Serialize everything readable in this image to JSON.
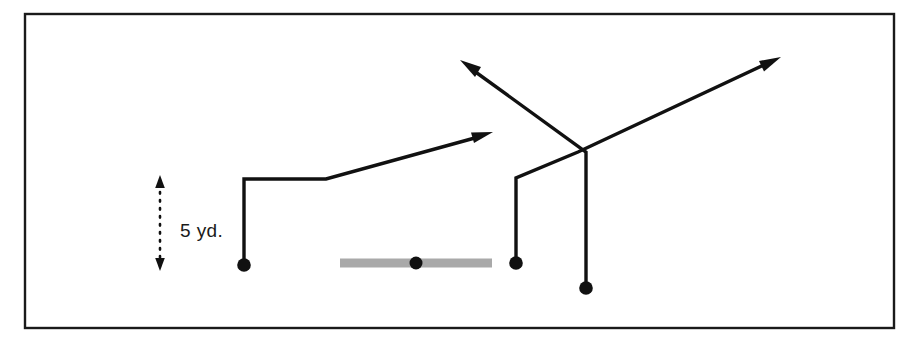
{
  "diagram": {
    "frame": {
      "x": 25,
      "y": 14,
      "width": 869,
      "height": 314,
      "stroke": "#1a1a1a"
    },
    "colors": {
      "ink": "#111111",
      "frame": "#1a1a1a",
      "line_of_scrimmage": "#a9a9a9",
      "background": "#ffffff"
    },
    "measurement": {
      "label": "5 yd.",
      "value": 5,
      "unit": "yd.",
      "x": 160,
      "y_top": 178,
      "y_bottom": 268,
      "label_x": 180,
      "label_y": 230,
      "arrowheads": "both"
    },
    "line_of_scrimmage": {
      "name": "offensive-line-bar",
      "x1": 340,
      "x2": 492,
      "y": 263,
      "color": "#a9a9a9",
      "center_dot": {
        "x": 416,
        "y": 263,
        "r": 6.5
      }
    },
    "players": [
      {
        "id": "player-left-split-end",
        "label": "left split end",
        "dot": {
          "x": 244,
          "y": 265,
          "r": 6.8
        },
        "route": {
          "name": "hitch-and-go-route",
          "points": "244,265 244,179 326,179 482,136",
          "arrowhead": {
            "x": 490,
            "y": 133,
            "angle": -15.4
          }
        }
      },
      {
        "id": "player-center-slot",
        "label": "center slot receiver",
        "dot": {
          "x": 516,
          "y": 263,
          "r": 6.8
        },
        "route": {
          "name": "crossing-route-right",
          "points": "516,263 516,178 578,152 770,62",
          "arrowhead": {
            "x": 779,
            "y": 58,
            "angle": -25.1
          }
        }
      },
      {
        "id": "player-right-slot",
        "label": "right slot receiver",
        "dot": {
          "x": 586,
          "y": 288,
          "r": 6.8
        },
        "route": {
          "name": "crossing-route-left",
          "points": "586,288 586,152 470,68",
          "arrowhead": {
            "x": 462,
            "y": 62,
            "angle": 215.9
          }
        }
      }
    ]
  }
}
